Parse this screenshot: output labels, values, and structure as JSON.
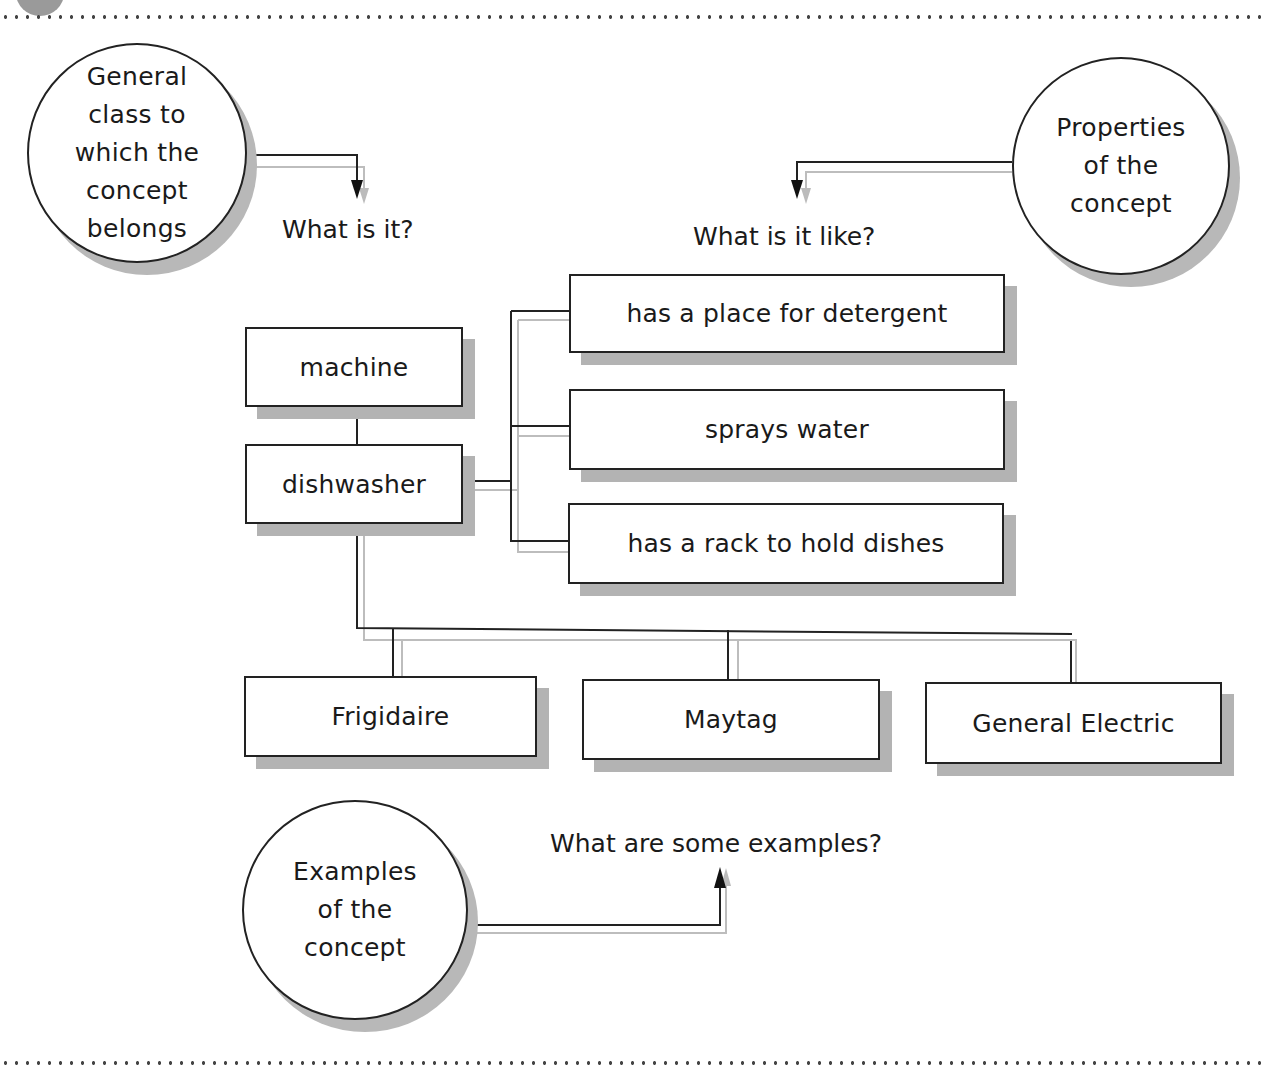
{
  "diagram": {
    "type": "concept-definition-map",
    "circles": {
      "class": {
        "label": "General\nclass to\nwhich the\nconcept\nbelongs"
      },
      "properties": {
        "label": "Properties\nof the\nconcept"
      },
      "examples": {
        "label": "Examples\nof the\nconcept"
      }
    },
    "questions": {
      "what_is_it": "What is it?",
      "what_is_it_like": "What is it like?",
      "examples": "What are some examples?"
    },
    "nodes": {
      "class": "machine",
      "concept": "dishwasher",
      "properties": [
        "has a place for detergent",
        "sprays water",
        "has a rack to hold dishes"
      ],
      "examples": [
        "Frigidaire",
        "Maytag",
        "General Electric"
      ]
    },
    "colors": {
      "line": "#222222",
      "shadow": "#b3b3b3",
      "background": "#ffffff"
    }
  }
}
